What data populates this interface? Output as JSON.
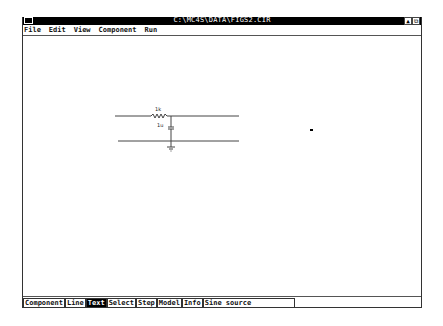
{
  "window": {
    "title": "C:\\MC4S\\DATA\\FIGS2.CIR",
    "control_box_icon": "control-menu-icon",
    "buttons": [
      {
        "name": "minimize-icon",
        "glyph": "▲"
      },
      {
        "name": "restore-icon",
        "glyph": "⧉"
      }
    ]
  },
  "menu": {
    "items": [
      "File",
      "Edit",
      "View",
      "Component",
      "Run"
    ]
  },
  "schematic": {
    "resistor": {
      "label": "1k"
    },
    "capacitor": {
      "label": "1u"
    },
    "ground": {
      "name": "ground"
    }
  },
  "toolbar": {
    "modes": [
      {
        "label": "Component",
        "active": false
      },
      {
        "label": "Line",
        "active": false
      },
      {
        "label": "Text",
        "active": true
      },
      {
        "label": "Select",
        "active": false
      },
      {
        "label": "Step",
        "active": false
      },
      {
        "label": "Model",
        "active": false
      },
      {
        "label": "Info",
        "active": false
      }
    ],
    "component_field": "Sine source"
  },
  "colors": {
    "titlebar": "#000000",
    "background": "#ffffff",
    "active_tool": "#000000"
  }
}
